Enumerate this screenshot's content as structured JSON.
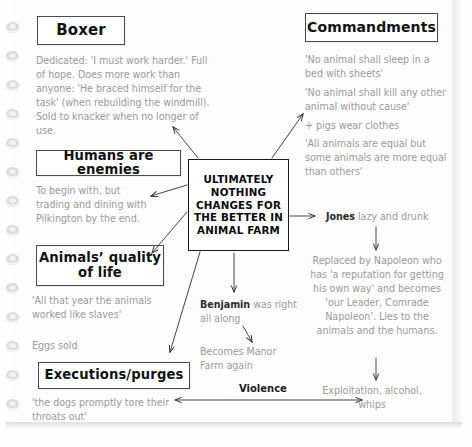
{
  "page": {
    "medium": "spiral-bound notebook page",
    "ring_count": 14
  },
  "center": {
    "text": "ULTIMATELY NOTHING CHANGES FOR THE BETTER IN ANIMAL FARM"
  },
  "branches": [
    {
      "id": "boxer",
      "heading": "Boxer",
      "body": "Dedicated: 'I must work harder.' Full of hope. Does more work than anyone: 'He braced himself for the task' (when rebuilding the windmill). Sold to knacker when no longer of use."
    },
    {
      "id": "humans-are-enemies",
      "heading": "Humans are enemies",
      "body": "To begin with, but trading and dining with Pilkington by the end."
    },
    {
      "id": "animals-quality-of-life",
      "heading": "Animals’ quality of life",
      "body_quote": "'All that year the animals worked like slaves'",
      "body_extra": "Eggs sold"
    },
    {
      "id": "executions-purges",
      "heading": "Executions/purges",
      "body": "'the dogs promptly tore their throats out'"
    },
    {
      "id": "commandments",
      "heading": "Commandments",
      "lines": [
        "'No animal shall sleep in a bed with sheets'",
        "'No animal shall kill any other animal without cause'",
        "+ pigs wear clothes",
        "'All animals are equal but some animals are more equal than others'"
      ]
    }
  ],
  "jones_chain": {
    "lead": "Jones",
    "lead_rest": " lazy and drunk",
    "step2": "Replaced by Napoleon who has 'a reputation for getting his own way' and becomes 'our Leader, Comrade Napoleon'. Lies to the animals and the humans.",
    "step3": "Exploitation, alcohol, whips"
  },
  "benjamin_chain": {
    "lead": "Benjamin",
    "lead_rest": " was right all along",
    "step2": "Becomes Manor Farm again"
  },
  "violence": {
    "label": "Violence"
  },
  "colors": {
    "ink_body": "#9a9a9a",
    "ink_heading": "#121212",
    "box_border": "#4a4a4a",
    "center_border": "#1a1a1a",
    "paper": "#fdfdfd",
    "ring": "#dcdcdc"
  }
}
